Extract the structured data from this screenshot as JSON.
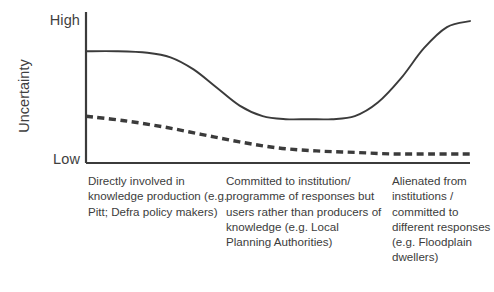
{
  "chart_data": {
    "type": "line",
    "title": "",
    "xlabel": "",
    "ylabel": "Uncertainty",
    "y_axis": {
      "label": "Uncertainty",
      "tick_labels": [
        "High",
        "Low"
      ],
      "high_label": "High",
      "low_label": "Low",
      "range_described": "Low to High (qualitative, unnumbered)"
    },
    "x_axis": {
      "label": "",
      "tick_labels": [],
      "categories": [
        "Directly involved in knowledge production (e.g. Pitt; Defra policy makers)",
        "Committed to institution/ programme of responses but users rather than producers of knowledge (e.g. Local Planning Authorities)",
        "Alienated from institutions / committed to different responses (e.g. Floodplain dwellers)"
      ]
    },
    "grid": false,
    "legend": "none",
    "series": [
      {
        "name": "solid-curve",
        "style": "solid",
        "color": "#3b3b3b",
        "description": "Starts at medium-high uncertainty, drops sharply across the first group, stays low through the middle group, then rises sharply to the highest value at the right.",
        "x": [
          0,
          8,
          16,
          22,
          28,
          34,
          40,
          46,
          52,
          58,
          64,
          70,
          76,
          82,
          88,
          94,
          100
        ],
        "y": [
          74,
          74,
          73,
          70,
          62,
          50,
          38,
          31,
          29,
          29,
          29,
          31,
          40,
          56,
          76,
          90,
          94
        ]
      },
      {
        "name": "dashed-curve",
        "style": "dashed",
        "color": "#3b3b3b",
        "description": "Starts at low-medium uncertainty and declines steadily, flattening just above the axis across the middle and right groups.",
        "x": [
          0,
          10,
          20,
          30,
          40,
          50,
          60,
          70,
          80,
          90,
          100
        ],
        "y": [
          31,
          28,
          24,
          19,
          14,
          10,
          8,
          7,
          6,
          6,
          6
        ]
      }
    ]
  },
  "labels": {
    "y_high": "High",
    "y_low": "Low",
    "y_axis_title": "Uncertainty"
  },
  "captions": {
    "group_1": "Directly involved in knowledge production (e.g. Pitt; Defra policy makers)",
    "group_2": "Committed to institution/ programme of responses but users rather than producers of knowledge (e.g. Local Planning Authorities)",
    "group_3": "Alienated from institutions / committed to different responses (e.g. Floodplain dwellers)"
  },
  "colors": {
    "line": "#3b3b3b",
    "axis": "#3b3b3b",
    "text": "#3c3c3c",
    "background": "#ffffff"
  }
}
